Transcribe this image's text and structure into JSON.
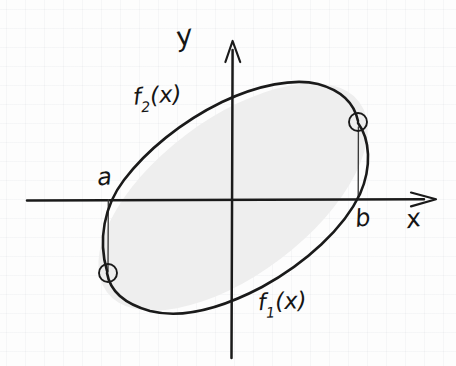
{
  "figure": {
    "medium": "hand-drawn pencil sketch on faint graph paper",
    "ink_color": "#1a1a1a",
    "region_fill_color": "#eeeeee",
    "paper_color": "#fdfdfd"
  },
  "axes": {
    "x_axis": {
      "label": "x",
      "origin_px": {
        "x": 232,
        "y": 200
      },
      "start_px": {
        "x": 27,
        "y": 200
      },
      "end_px": {
        "x": 437,
        "y": 200
      },
      "has_arrowhead": true,
      "arrow_direction": "right"
    },
    "y_axis": {
      "label": "y",
      "start_px": {
        "x": 232,
        "y": 358
      },
      "end_px": {
        "x": 232,
        "y": 41
      },
      "has_arrowhead": true,
      "arrow_direction": "up"
    }
  },
  "curves": [
    {
      "name": "upper-curve",
      "label": "f",
      "subscript": "2",
      "argument": "(x)",
      "label_text": "f2(x)",
      "description": "upper boundary arc of the tilted ellipse"
    },
    {
      "name": "lower-curve",
      "label": "f",
      "subscript": "1",
      "argument": "(x)",
      "label_text": "f1(x)",
      "description": "lower boundary arc of the tilted ellipse"
    }
  ],
  "boundary_points": [
    {
      "name": "left-endpoint",
      "x_label": "a",
      "position_px": {
        "x": 108,
        "y": 273
      },
      "marker": "open-circle",
      "below_axis": true,
      "connector": "vertical drop line from x-axis to the point"
    },
    {
      "name": "right-endpoint",
      "x_label": "b",
      "position_px": {
        "x": 358,
        "y": 122
      },
      "marker": "open-circle",
      "below_axis": false,
      "connector": "vertical line from x-axis up to the point"
    }
  ],
  "labels": {
    "y_axis": "y",
    "x_axis": "x",
    "left_bound": "a",
    "right_bound": "b",
    "upper_function_f": "f",
    "upper_function_sub": "2",
    "upper_function_arg": "(x)",
    "lower_function_f": "f",
    "lower_function_sub": "1",
    "lower_function_arg": "(x)"
  },
  "shaded_region": {
    "name": "area-between-curves",
    "shape": "tilted ellipse",
    "center_px": {
      "x": 233,
      "y": 197
    },
    "semi_major_px": 158,
    "semi_minor_px": 78,
    "rotation_deg": -37,
    "fill": "#eeeeee"
  }
}
